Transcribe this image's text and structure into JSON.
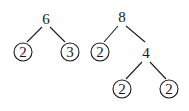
{
  "trees": [
    {
      "root": "6",
      "children": [
        "2",
        "3"
      ],
      "circled_leaves": [
        "2",
        "3"
      ]
    },
    {
      "root": "8",
      "children": [
        "2",
        "4"
      ],
      "subtree": {
        "root": "4",
        "children": [
          "2",
          "2"
        ]
      },
      "circled_leaves": [
        "2",
        "2",
        "2"
      ]
    }
  ],
  "labels": {
    "t1_root": "6",
    "t1_left": "2",
    "t1_right": "3",
    "t2_root": "8",
    "t2_left": "2",
    "t2_mid": "4",
    "t2_mid_left": "2",
    "t2_mid_right": "2"
  },
  "colors": {
    "ink": "#1a1a1a",
    "background": "#ffffff"
  }
}
